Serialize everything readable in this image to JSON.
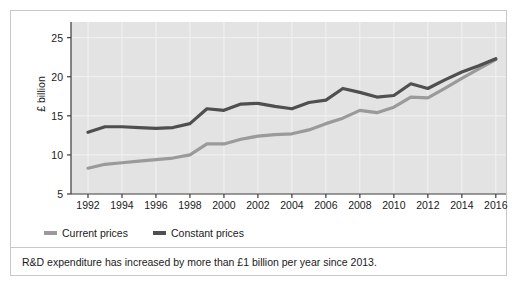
{
  "chart_data": {
    "type": "line",
    "title": "",
    "xlabel": "",
    "ylabel": "£ billion",
    "xlim": [
      1991,
      2016.6
    ],
    "ylim": [
      5,
      27
    ],
    "grid": true,
    "legend_position": "bottom-left",
    "x": [
      1992,
      1993,
      1994,
      1995,
      1996,
      1997,
      1998,
      1999,
      2000,
      2001,
      2002,
      2003,
      2004,
      2005,
      2006,
      2007,
      2008,
      2009,
      2010,
      2011,
      2012,
      2013,
      2014,
      2015,
      2016
    ],
    "xticks": [
      1992,
      1994,
      1996,
      1998,
      2000,
      2002,
      2004,
      2006,
      2008,
      2010,
      2012,
      2014,
      2016
    ],
    "yticks": [
      5,
      10,
      15,
      20,
      25
    ],
    "series": [
      {
        "name": "Current prices",
        "color": "#9a9a9a",
        "values": [
          8.3,
          8.8,
          9.0,
          9.2,
          9.4,
          9.6,
          10.0,
          11.4,
          11.4,
          12.0,
          12.4,
          12.6,
          12.7,
          13.2,
          14.0,
          14.7,
          15.7,
          15.4,
          16.1,
          17.4,
          17.3,
          18.5,
          19.8,
          21.0,
          22.2
        ]
      },
      {
        "name": "Constant prices",
        "color": "#4f4f4f",
        "values": [
          12.9,
          13.6,
          13.6,
          13.5,
          13.4,
          13.5,
          14.0,
          15.9,
          15.7,
          16.5,
          16.6,
          16.2,
          15.9,
          16.7,
          17.0,
          18.5,
          18.0,
          17.4,
          17.6,
          19.1,
          18.5,
          19.6,
          20.6,
          21.4,
          22.3
        ]
      }
    ]
  },
  "legend": {
    "items": [
      {
        "label": "Current prices"
      },
      {
        "label": "Constant prices"
      }
    ]
  },
  "caption": {
    "text": "R&D expenditure has increased by more than £1 billion per year since 2013."
  },
  "colors": {
    "plot_background": "#e3e3e3",
    "gridline": "#f2f2f2",
    "axis": "#3a3a3a",
    "card_border": "#c8c8c8",
    "text": "#1a1a1a"
  }
}
